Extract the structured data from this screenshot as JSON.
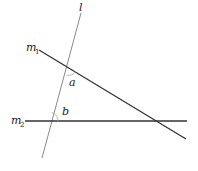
{
  "diagram": {
    "type": "transversal-lines",
    "colors": {
      "transversal": "#8a8a8a",
      "parallel_lines": "#333333",
      "arc": "#aaaaaa",
      "text": "#222222"
    },
    "lines": {
      "l": {
        "label": "l",
        "x1": 81,
        "y1": 13,
        "x2": 42,
        "y2": 158
      },
      "m1": {
        "label": "m",
        "subscript": "1",
        "x1": 39,
        "y1": 50,
        "x2": 186,
        "y2": 139
      },
      "m2": {
        "label": "m",
        "subscript": "2",
        "x1": 25,
        "y1": 121,
        "x2": 187,
        "y2": 121
      }
    },
    "angles": {
      "a": {
        "label": "a"
      },
      "b": {
        "label": "b"
      }
    }
  }
}
